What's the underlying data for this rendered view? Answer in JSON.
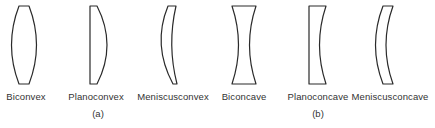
{
  "figure": {
    "groups": [
      {
        "id": "a",
        "label": "(a)",
        "type": "converging",
        "lenses": [
          {
            "name": "Biconvex"
          },
          {
            "name": "Planoconvex"
          },
          {
            "name": "Meniscusconvex"
          }
        ]
      },
      {
        "id": "b",
        "label": "(b)",
        "type": "diverging",
        "lenses": [
          {
            "name": "Biconcave"
          },
          {
            "name": "Planoconcave"
          },
          {
            "name": "Meniscusconcave"
          }
        ]
      }
    ],
    "colors": {
      "stroke": "#2a2a2a",
      "text": "#333333",
      "background": "#ffffff"
    }
  }
}
